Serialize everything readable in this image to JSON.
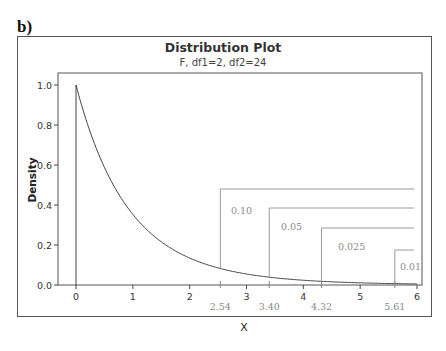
{
  "panel_label": "b)",
  "chart_data": {
    "type": "line",
    "title": "Distribution Plot",
    "subtitle": "F, df1=2, df2=24",
    "xlabel": "X",
    "ylabel": "Density",
    "xlim": [
      -0.3,
      6.1
    ],
    "ylim": [
      0.0,
      1.05
    ],
    "xticks": [
      0,
      1,
      2,
      3,
      4,
      5,
      6
    ],
    "yticks": [
      "0.0",
      "0.2",
      "0.4",
      "0.6",
      "0.8",
      "1.0"
    ],
    "grid": false,
    "series": [
      {
        "name": "F(2,24) density",
        "x": [
          0,
          0.25,
          0.5,
          0.75,
          1.0,
          1.25,
          1.5,
          1.75,
          2.0,
          2.5,
          3.0,
          3.5,
          4.0,
          4.5,
          5.0,
          5.5,
          6.0
        ],
        "y": [
          1.0,
          0.79,
          0.627,
          0.5,
          0.4,
          0.322,
          0.26,
          0.21,
          0.171,
          0.114,
          0.077,
          0.053,
          0.037,
          0.026,
          0.018,
          0.013,
          0.009
        ]
      }
    ],
    "critical_values": [
      {
        "alpha": "0.10",
        "x": 2.54,
        "x_label": "2.54"
      },
      {
        "alpha": "0.05",
        "x": 3.4,
        "x_label": "3.40"
      },
      {
        "alpha": "0.025",
        "x": 4.32,
        "x_label": "4.32"
      },
      {
        "alpha": "0.01",
        "x": 5.61,
        "x_label": "5.61"
      }
    ]
  }
}
